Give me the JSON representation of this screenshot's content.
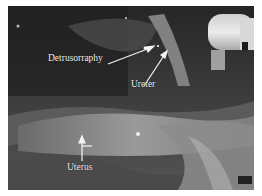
{
  "figure": {
    "type": "laparoscopic surgical photograph (grayscale)",
    "labels": [
      {
        "text": "Detrusorraphy",
        "x": 48,
        "y": 60
      },
      {
        "text": "Ureter",
        "x": 131,
        "y": 80
      },
      {
        "text": "Uterus",
        "x": 67,
        "y": 163
      }
    ],
    "arrows": [
      {
        "name": "detrusorraphy-arrow",
        "from": [
          108,
          64
        ],
        "to": [
          150,
          48
        ]
      },
      {
        "name": "ureter-arrow",
        "from": [
          143,
          83
        ],
        "to": [
          165,
          50
        ]
      },
      {
        "name": "uterus-arrow",
        "from": [
          82,
          155
        ],
        "to": [
          82,
          138
        ]
      }
    ],
    "instrument_text": "INTUITIVE"
  }
}
